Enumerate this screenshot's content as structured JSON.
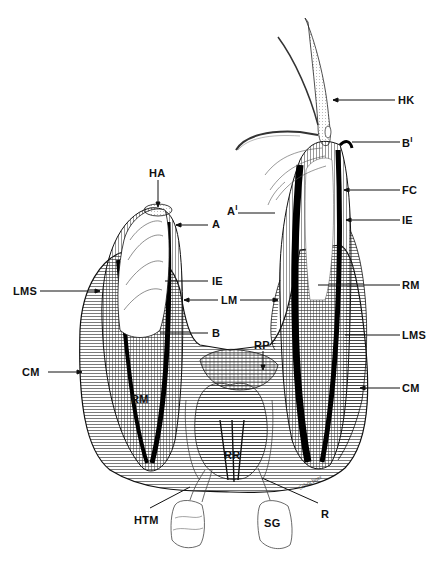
{
  "figure": {
    "type": "anatomical line drawing",
    "ink_color": "#111111",
    "background": "#ffffff",
    "signature": "Schöchner"
  },
  "labels": [
    {
      "id": "HK",
      "text": "HK",
      "x": 398,
      "y": 95
    },
    {
      "id": "B1",
      "text": "B",
      "sup": "I",
      "x": 402,
      "y": 136
    },
    {
      "id": "FC",
      "text": "FC",
      "x": 402,
      "y": 185
    },
    {
      "id": "A1",
      "text": "A",
      "sup": "I",
      "x": 229,
      "y": 204
    },
    {
      "id": "IE_right",
      "text": "IE",
      "x": 402,
      "y": 215
    },
    {
      "id": "HA",
      "text": "HA",
      "x": 149,
      "y": 170
    },
    {
      "id": "A",
      "text": "A",
      "x": 212,
      "y": 219
    },
    {
      "id": "IE_left",
      "text": "IE",
      "x": 212,
      "y": 276
    },
    {
      "id": "LMS_left",
      "text": "LMS",
      "x": 13,
      "y": 286
    },
    {
      "id": "LM",
      "text": "LM",
      "x": 221,
      "y": 295
    },
    {
      "id": "RM_right",
      "text": "RM",
      "x": 402,
      "y": 280
    },
    {
      "id": "B",
      "text": "B",
      "x": 212,
      "y": 328
    },
    {
      "id": "RP",
      "text": "RP",
      "x": 254,
      "y": 341
    },
    {
      "id": "LMS_right",
      "text": "LMS",
      "x": 402,
      "y": 330
    },
    {
      "id": "CM_left",
      "text": "CM",
      "x": 24,
      "y": 367
    },
    {
      "id": "CM_right",
      "text": "CM",
      "x": 402,
      "y": 383
    },
    {
      "id": "RM_left",
      "text": "RM",
      "x": 131,
      "y": 394
    },
    {
      "id": "RR",
      "text": "RR",
      "x": 224,
      "y": 451
    },
    {
      "id": "R",
      "text": "R",
      "x": 321,
      "y": 510
    },
    {
      "id": "HTM",
      "text": "HTM",
      "x": 134,
      "y": 516
    },
    {
      "id": "SG",
      "text": "SG",
      "x": 264,
      "y": 519
    }
  ]
}
